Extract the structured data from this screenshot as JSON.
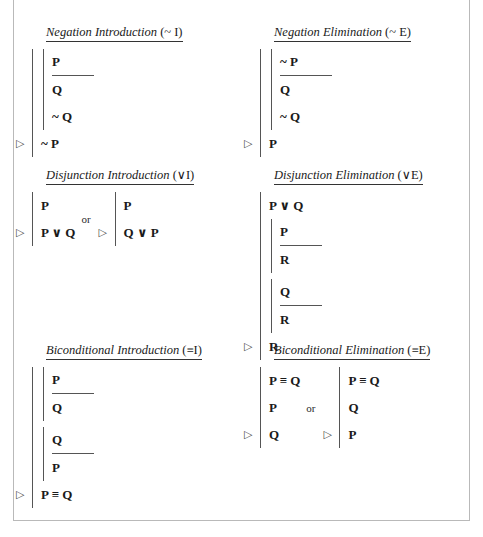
{
  "document": {
    "title": "Natural Deduction Rules",
    "or_label": "or",
    "marker_glyph": "▷",
    "symbols": {
      "negation": "~",
      "disjunction": "∨",
      "biconditional": "≡"
    }
  },
  "rules": [
    {
      "id": "negation-introduction",
      "name": "Negation Introduction",
      "abbr": "(~ I)",
      "variants": [
        {
          "main_lines": [],
          "subproofs": [
            {
              "assumption": "P",
              "lines": [
                "Q",
                "~ Q"
              ]
            }
          ],
          "conclusion": "~ P"
        }
      ]
    },
    {
      "id": "negation-elimination",
      "name": "Negation Elimination",
      "abbr": "(~ E)",
      "variants": [
        {
          "main_lines": [],
          "subproofs": [
            {
              "assumption": "~ P",
              "lines": [
                "Q",
                "~ Q"
              ]
            }
          ],
          "conclusion": "P"
        }
      ]
    },
    {
      "id": "disjunction-introduction",
      "name": "Disjunction Introduction",
      "abbr": "(∨I)",
      "variants": [
        {
          "main_lines": [
            "P"
          ],
          "subproofs": [],
          "conclusion": "P ∨ Q"
        },
        {
          "main_lines": [
            "P"
          ],
          "subproofs": [],
          "conclusion": "Q ∨ P"
        }
      ]
    },
    {
      "id": "disjunction-elimination",
      "name": "Disjunction Elimination",
      "abbr": "(∨E)",
      "variants": [
        {
          "main_lines": [
            "P ∨ Q"
          ],
          "subproofs": [
            {
              "assumption": "P",
              "lines": [
                "R"
              ]
            },
            {
              "assumption": "Q",
              "lines": [
                "R"
              ]
            }
          ],
          "conclusion": "R"
        }
      ]
    },
    {
      "id": "biconditional-introduction",
      "name": "Biconditional Introduction",
      "abbr": "(≡I)",
      "variants": [
        {
          "main_lines": [],
          "subproofs": [
            {
              "assumption": "P",
              "lines": [
                "Q"
              ]
            },
            {
              "assumption": "Q",
              "lines": [
                "P"
              ]
            }
          ],
          "conclusion": "P ≡ Q"
        }
      ]
    },
    {
      "id": "biconditional-elimination",
      "name": "Biconditional Elimination",
      "abbr": "(≡E)",
      "variants": [
        {
          "main_lines": [
            "P ≡ Q",
            "P"
          ],
          "subproofs": [],
          "conclusion": "Q"
        },
        {
          "main_lines": [
            "P ≡ Q",
            "Q"
          ],
          "subproofs": [],
          "conclusion": "P"
        }
      ]
    }
  ]
}
